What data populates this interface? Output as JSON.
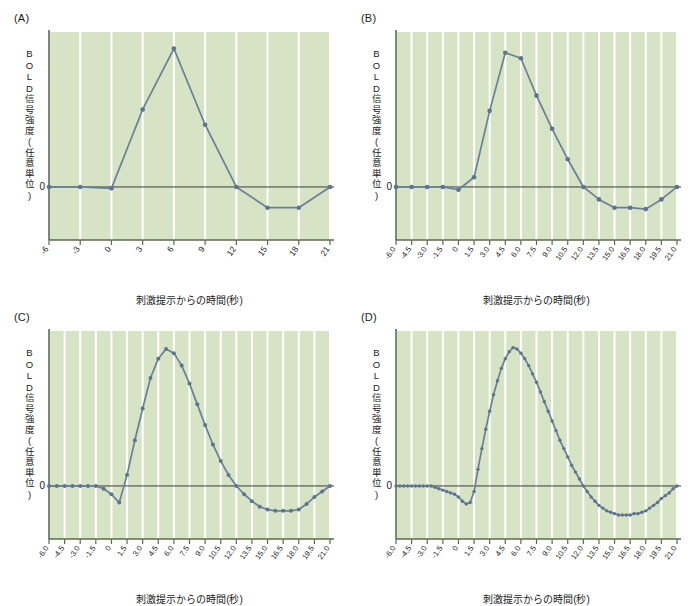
{
  "figure": {
    "background": "#ffffff",
    "plot_background": "#d6e3c4",
    "gridline_color": "#ffffff",
    "line_color": "#6b7f99",
    "marker_color": "#5d7390",
    "axis_color": "#5a6b52",
    "zero_line_color": "#3c3c3c"
  },
  "panels": [
    {
      "letter": "(A)",
      "tr_label": "TR = 3,000ミリ秒",
      "ylabel": "BOLD信号強度(任意単位)",
      "xlabel": "刺激提示からの時間(秒)",
      "zero_label": "0",
      "xticks": [
        "-6",
        "-3",
        "0",
        "3",
        "6",
        "9",
        "12",
        "15",
        "18",
        "21"
      ],
      "chart_data": {
        "type": "line",
        "title": "TR = 3,000ミリ秒",
        "xlabel": "刺激提示からの時間(秒)",
        "ylabel": "BOLD信号強度(任意単位)",
        "xlim": [
          -6,
          21
        ],
        "ylim": [
          -0.35,
          1.12
        ],
        "grid": "vertical",
        "x": [
          -6,
          -3,
          0,
          3,
          6,
          9,
          12,
          15,
          18,
          21
        ],
        "values": [
          0.0,
          0.0,
          -0.01,
          0.56,
          1.0,
          0.45,
          0.0,
          -0.15,
          -0.15,
          0.0
        ]
      }
    },
    {
      "letter": "(B)",
      "tr_label": "TR = 1,500ミリ秒",
      "ylabel": "BOLD信号強度(任意単位)",
      "xlabel": "刺激提示からの時間(秒)",
      "zero_label": "0",
      "xticks": [
        "-6.0",
        "-4.5",
        "-3.0",
        "-1.5",
        "0",
        "1.5",
        "3.0",
        "4.5",
        "6.0",
        "7.5",
        "9.0",
        "10.5",
        "12.0",
        "13.5",
        "15.0",
        "16.5",
        "18.0",
        "19.5",
        "21.0"
      ],
      "chart_data": {
        "type": "line",
        "title": "TR = 1,500ミリ秒",
        "xlabel": "刺激提示からの時間(秒)",
        "ylabel": "BOLD信号強度(任意単位)",
        "xlim": [
          -6,
          21
        ],
        "ylim": [
          -0.35,
          1.12
        ],
        "grid": "vertical",
        "x": [
          -6.0,
          -4.5,
          -3.0,
          -1.5,
          0,
          1.5,
          3.0,
          4.5,
          6.0,
          7.5,
          9.0,
          10.5,
          12.0,
          13.5,
          15.0,
          16.5,
          18.0,
          19.5,
          21.0
        ],
        "values": [
          0.0,
          0.0,
          0.0,
          0.0,
          -0.02,
          0.07,
          0.55,
          0.97,
          0.93,
          0.66,
          0.42,
          0.2,
          0.0,
          -0.09,
          -0.15,
          -0.15,
          -0.16,
          -0.09,
          0.0
        ]
      }
    },
    {
      "letter": "(C)",
      "tr_label": "TR = 750ミリ秒",
      "ylabel": "BOLD信号強度(任意単位)",
      "xlabel": "刺激提示からの時間(秒)",
      "zero_label": "0",
      "xticks": [
        "-6.0",
        "-4.5",
        "-3.0",
        "-1.5",
        "0",
        "1.5",
        "3.0",
        "4.5",
        "6.0",
        "7.5",
        "9.0",
        "10.5",
        "12.0",
        "13.5",
        "15.0",
        "16.5",
        "18.0",
        "19.5",
        "21.0"
      ],
      "chart_data": {
        "type": "line",
        "title": "TR = 750ミリ秒",
        "xlabel": "刺激提示からの時間(秒)",
        "ylabel": "BOLD信号強度(任意単位)",
        "xlim": [
          -6,
          21
        ],
        "ylim": [
          -0.35,
          1.12
        ],
        "grid": "vertical",
        "x": [
          -6.0,
          -5.25,
          -4.5,
          -3.75,
          -3.0,
          -2.25,
          -1.5,
          -0.75,
          0,
          0.75,
          1.5,
          2.25,
          3.0,
          3.75,
          4.5,
          5.25,
          6.0,
          6.75,
          7.5,
          8.25,
          9.0,
          9.75,
          10.5,
          11.25,
          12.0,
          12.75,
          13.5,
          14.25,
          15.0,
          15.75,
          16.5,
          17.25,
          18.0,
          18.75,
          19.5,
          20.25,
          21.0
        ],
        "values": [
          0.0,
          0.0,
          0.0,
          0.0,
          0.0,
          0.0,
          0.0,
          -0.02,
          -0.06,
          -0.12,
          0.08,
          0.33,
          0.56,
          0.78,
          0.92,
          0.99,
          0.96,
          0.87,
          0.74,
          0.59,
          0.44,
          0.3,
          0.18,
          0.08,
          0.0,
          -0.06,
          -0.11,
          -0.15,
          -0.17,
          -0.18,
          -0.18,
          -0.18,
          -0.17,
          -0.13,
          -0.08,
          -0.04,
          0.0
        ]
      }
    },
    {
      "letter": "(D)",
      "tr_label": "TR = 375ミリ秒",
      "ylabel": "BOLD信号強度(任意単位)",
      "xlabel": "刺激提示からの時間(秒)",
      "zero_label": "0",
      "xticks": [
        "-6.0",
        "-4.5",
        "-3.0",
        "-1.5",
        "0",
        "1.5",
        "3.0",
        "4.5",
        "6.0",
        "7.5",
        "9.0",
        "10.5",
        "12.0",
        "13.5",
        "15.0",
        "16.5",
        "18.0",
        "19.5",
        "21.0"
      ],
      "chart_data": {
        "type": "line",
        "title": "TR = 375ミリ秒",
        "xlabel": "刺激提示からの時間(秒)",
        "ylabel": "BOLD信号強度(任意単位)",
        "xlim": [
          -6,
          21
        ],
        "ylim": [
          -0.35,
          1.12
        ],
        "grid": "vertical",
        "x": [
          -6.0,
          -5.625,
          -5.25,
          -4.875,
          -4.5,
          -4.125,
          -3.75,
          -3.375,
          -3.0,
          -2.625,
          -2.25,
          -1.875,
          -1.5,
          -1.125,
          -0.75,
          -0.375,
          0,
          0.375,
          0.75,
          1.125,
          1.5,
          1.875,
          2.25,
          2.625,
          3.0,
          3.375,
          3.75,
          4.125,
          4.5,
          4.875,
          5.25,
          5.625,
          6.0,
          6.375,
          6.75,
          7.125,
          7.5,
          7.875,
          8.25,
          8.625,
          9.0,
          9.375,
          9.75,
          10.125,
          10.5,
          10.875,
          11.25,
          11.625,
          12.0,
          12.375,
          12.75,
          13.125,
          13.5,
          13.875,
          14.25,
          14.625,
          15.0,
          15.375,
          15.75,
          16.125,
          16.5,
          16.875,
          17.25,
          17.625,
          18.0,
          18.375,
          18.75,
          19.125,
          19.5,
          19.875,
          20.25,
          20.625,
          21.0
        ],
        "values": [
          0.0,
          0.0,
          0.0,
          0.0,
          0.0,
          0.0,
          0.0,
          0.0,
          0.0,
          0.0,
          -0.01,
          -0.02,
          -0.03,
          -0.04,
          -0.05,
          -0.06,
          -0.08,
          -0.11,
          -0.13,
          -0.12,
          -0.04,
          0.12,
          0.27,
          0.41,
          0.54,
          0.66,
          0.76,
          0.85,
          0.92,
          0.97,
          1.0,
          0.99,
          0.96,
          0.92,
          0.87,
          0.81,
          0.75,
          0.68,
          0.61,
          0.54,
          0.47,
          0.4,
          0.33,
          0.27,
          0.21,
          0.15,
          0.1,
          0.05,
          0.0,
          -0.04,
          -0.08,
          -0.11,
          -0.14,
          -0.16,
          -0.18,
          -0.19,
          -0.2,
          -0.21,
          -0.21,
          -0.21,
          -0.21,
          -0.2,
          -0.2,
          -0.19,
          -0.18,
          -0.16,
          -0.14,
          -0.12,
          -0.09,
          -0.07,
          -0.05,
          -0.02,
          0.0
        ]
      }
    }
  ]
}
